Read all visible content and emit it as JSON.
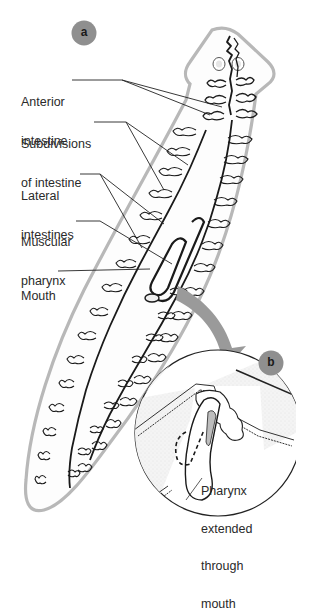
{
  "figure": {
    "panel_a_label": "a",
    "panel_b_label": "b",
    "labels": [
      {
        "id": "anterior-intestine",
        "line1": "Anterior",
        "line2": "intestine"
      },
      {
        "id": "subdivisions-of-intestine",
        "line1": "Subdivisions",
        "line2": "of intestine"
      },
      {
        "id": "lateral-intestines",
        "line1": "Lateral",
        "line2": "intestines"
      },
      {
        "id": "muscular-pharynx",
        "line1": "Muscular",
        "line2": "pharynx"
      },
      {
        "id": "mouth",
        "line1": "Mouth"
      }
    ],
    "inset_label": {
      "line1": "Pharynx",
      "line2": "extended",
      "line3": "through",
      "line4": "mouth"
    },
    "colors": {
      "badge": "#8f8f8f",
      "outline": "#b8b8b8",
      "arrow": "#9a9a9a",
      "ink": "#1a1a1a"
    }
  }
}
